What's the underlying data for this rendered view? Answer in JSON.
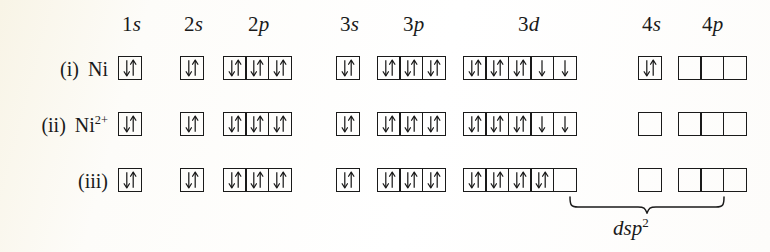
{
  "figure": {
    "background_color": "#fdfcf7",
    "ink_color": "#1a1a1a"
  },
  "headers": [
    {
      "id": "1s",
      "shell": "1",
      "subshell": "s",
      "label": "1s",
      "x": 122,
      "y": 14
    },
    {
      "id": "2s",
      "shell": "2",
      "subshell": "s",
      "label": "2s",
      "x": 184,
      "y": 14
    },
    {
      "id": "2p",
      "shell": "2",
      "subshell": "p",
      "label": "2p",
      "x": 248,
      "y": 14
    },
    {
      "id": "3s",
      "shell": "3",
      "subshell": "s",
      "label": "3s",
      "x": 340,
      "y": 14
    },
    {
      "id": "3p",
      "shell": "3",
      "subshell": "p",
      "label": "3p",
      "x": 403,
      "y": 14
    },
    {
      "id": "3d",
      "shell": "3",
      "subshell": "d",
      "label": "3d",
      "x": 518,
      "y": 14
    },
    {
      "id": "4s",
      "shell": "4",
      "subshell": "s",
      "label": "4s",
      "x": 642,
      "y": 14
    },
    {
      "id": "4p",
      "shell": "4",
      "subshell": "p",
      "label": "4p",
      "x": 702,
      "y": 14
    }
  ],
  "rows": [
    {
      "index_label": "(i)",
      "species_label": "Ni",
      "species_charge": "",
      "y": 56,
      "orbitals": {
        "1s": [
          "updown"
        ],
        "2s": [
          "updown"
        ],
        "2p": [
          "updown",
          "updown",
          "updown"
        ],
        "3s": [
          "updown"
        ],
        "3p": [
          "updown",
          "updown",
          "updown"
        ],
        "3d": [
          "updown",
          "updown",
          "updown",
          "down",
          "down"
        ],
        "4s": [
          "updown"
        ],
        "4p": [
          "empty",
          "empty",
          "empty"
        ]
      }
    },
    {
      "index_label": "(ii)",
      "species_label": "Ni",
      "species_charge": "2+",
      "y": 112,
      "orbitals": {
        "1s": [
          "updown"
        ],
        "2s": [
          "updown"
        ],
        "2p": [
          "updown",
          "updown",
          "updown"
        ],
        "3s": [
          "updown"
        ],
        "3p": [
          "updown",
          "updown",
          "updown"
        ],
        "3d": [
          "updown",
          "updown",
          "updown",
          "down",
          "down"
        ],
        "4s": [
          "empty"
        ],
        "4p": [
          "empty",
          "empty",
          "empty"
        ]
      }
    },
    {
      "index_label": "(iii)",
      "species_label": "",
      "species_charge": "",
      "y": 168,
      "orbitals": {
        "1s": [
          "updown"
        ],
        "2s": [
          "updown"
        ],
        "2p": [
          "updown",
          "updown",
          "updown"
        ],
        "3s": [
          "updown"
        ],
        "3p": [
          "updown",
          "updown",
          "updown"
        ],
        "3d": [
          "updown",
          "updown",
          "updown",
          "updown",
          "empty"
        ],
        "4s": [
          "empty"
        ],
        "4p": [
          "empty",
          "empty",
          "empty"
        ]
      }
    }
  ],
  "group_positions": {
    "1s": {
      "x": 118,
      "count": 1
    },
    "2s": {
      "x": 180,
      "count": 1
    },
    "2p": {
      "x": 223,
      "count": 3
    },
    "3s": {
      "x": 336,
      "count": 1
    },
    "3p": {
      "x": 377,
      "count": 3
    },
    "3d": {
      "x": 463,
      "count": 5
    },
    "4s": {
      "x": 638,
      "count": 1
    },
    "4p": {
      "x": 678,
      "count": 3
    }
  },
  "annotation": {
    "brace": {
      "x": 568,
      "y": 196,
      "width": 158,
      "height": 18
    },
    "label_base": "dsp",
    "label_sup": "2",
    "label_x": 613,
    "label_y": 218
  },
  "row_label_positions": {
    "right_edge": 108
  }
}
